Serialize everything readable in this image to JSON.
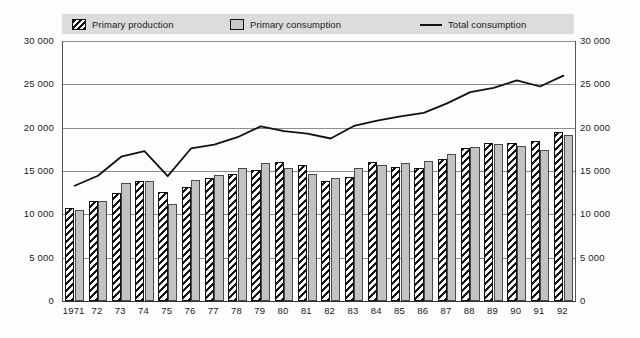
{
  "legend": {
    "items": [
      {
        "label": "Primary production",
        "style": "hatch"
      },
      {
        "label": "Primary consumption",
        "style": "solid"
      },
      {
        "label": "Total consumption",
        "style": "line"
      }
    ]
  },
  "axis": {
    "y_ticks": [
      "0",
      "5 000",
      "10 000",
      "15 000",
      "20 000",
      "25 000",
      "30 000"
    ],
    "y_ticks_right": [
      "0",
      "5 000",
      "10 000",
      "15 000",
      "20 000",
      "25 000",
      "30 000"
    ]
  },
  "colors": {
    "legend_background": "#dcdcdc",
    "gridline": "#8d8d8d",
    "bar_production_fill": "#ffffff",
    "bar_production_hatch": "#151515",
    "bar_consumption_fill": "#c2c2c2",
    "line": "#111111",
    "axis": "#333333"
  },
  "chart_data": {
    "type": "bar",
    "title": "",
    "subtitle": "",
    "xlabel": "",
    "ylabel": "",
    "ylim": [
      0,
      30000
    ],
    "ytick_step": 5000,
    "grid": true,
    "legend_position": "top",
    "categories": [
      "1971",
      "72",
      "73",
      "74",
      "75",
      "76",
      "77",
      "78",
      "79",
      "80",
      "81",
      "82",
      "83",
      "84",
      "85",
      "86",
      "87",
      "88",
      "89",
      "90",
      "91",
      "92"
    ],
    "series": [
      {
        "name": "Primary production",
        "type": "bar",
        "values": [
          10750,
          11500,
          12500,
          13800,
          12550,
          13100,
          14250,
          14600,
          15150,
          16000,
          15700,
          13900,
          14300,
          16000,
          15500,
          15300,
          16400,
          17600,
          18200,
          18200,
          18500,
          19550
        ]
      },
      {
        "name": "Primary consumption",
        "type": "bar",
        "values": [
          10500,
          11550,
          13600,
          13900,
          11200,
          14000,
          14500,
          15300,
          15900,
          15300,
          14600,
          14150,
          15300,
          15700,
          15900,
          16150,
          17000,
          17800,
          18150,
          17900,
          17400,
          19200
        ]
      },
      {
        "name": "Total consumption",
        "type": "line",
        "values": [
          13300,
          14450,
          16650,
          17300,
          14400,
          17600,
          18050,
          18900,
          20150,
          19600,
          19300,
          18750,
          20200,
          20800,
          21300,
          21700,
          22800,
          24100,
          24600,
          25450,
          24750,
          26000
        ]
      }
    ]
  }
}
